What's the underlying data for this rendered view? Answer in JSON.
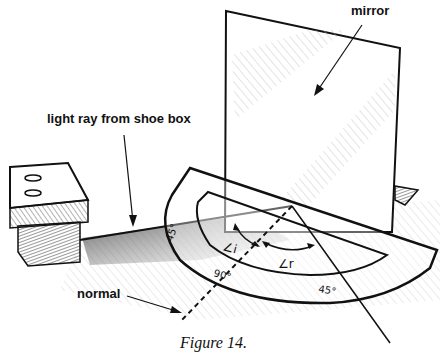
{
  "figure": {
    "caption": "Figure 14.",
    "labels": {
      "mirror": "mirror",
      "light_ray": "light ray from shoe box",
      "normal": "normal"
    },
    "protractor_marks": {
      "left": "45°",
      "center": "90°",
      "right": "45°"
    },
    "angles": {
      "incidence": "∠i",
      "reflection": "∠r"
    },
    "colors": {
      "ink": "#111111",
      "shade": "#555555",
      "background": "#ffffff"
    }
  }
}
